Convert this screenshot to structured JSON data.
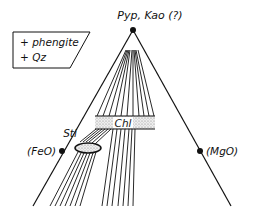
{
  "diagram": {
    "apex_label": "Pyp, Kao (?)",
    "left_label": "(FeO)",
    "right_label": "(MgO)",
    "legend": {
      "line1": "+ phengite",
      "line2": "+ Qz"
    },
    "phases": {
      "chlorite": "Chl",
      "staurolite": "Sti"
    },
    "colors": {
      "ink": "#111111",
      "background": "#ffffff",
      "stipple": "#c8c8c8"
    }
  }
}
